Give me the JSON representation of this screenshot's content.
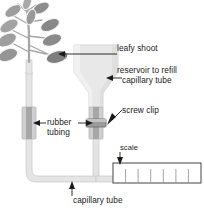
{
  "diagram": {
    "type": "scientific-apparatus-diagram",
    "background_color": "#ffffff",
    "line_color": "#1a1a1a",
    "glass_fill": "#e8e8e8",
    "glass_stroke": "#c9c9c9",
    "leaf_fill_dark": "#8f8f8f",
    "leaf_fill_light": "#b5b5b5",
    "clip_fill": "#a8a8a8",
    "tubing_fill": "#bdbdbd"
  },
  "labels": {
    "leafy_shoot": "leafy shoot",
    "reservoir_line1": "reservoir to refill",
    "reservoir_line2": "capillary tube",
    "screw_clip": "screw clip",
    "rubber_line1": "rubber",
    "rubber_line2": "tubing",
    "scale": "scale",
    "capillary_tube": "capillary tube"
  },
  "scale_bar": {
    "tick_count": 6,
    "divisions": 7
  }
}
